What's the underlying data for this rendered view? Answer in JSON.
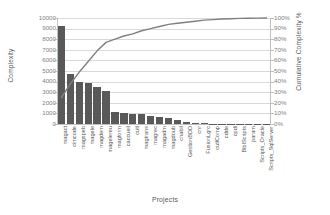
{
  "chart_data": {
    "type": "bar",
    "title": "",
    "xlabel": "Projects",
    "ylabel": "Complexity",
    "y2label": "Cumulative Complexity %",
    "ylim": [
      0,
      10000
    ],
    "y2lim": [
      0,
      100
    ],
    "grid": true,
    "legend": "none",
    "categories": [
      "magact",
      "cimcode",
      "magspeb",
      "magele",
      "magdem",
      "magelereu",
      "magform",
      "caccueil",
      "cutl",
      "magtrans",
      "magrec",
      "magadm",
      "magdoub",
      "chabil",
      "GestionBDD",
      "cnr",
      "FusionLgrc",
      "cutlComp",
      "cdde",
      "cpdi",
      "BiblScripts",
      "param",
      "Scripts_Oracle",
      "Scripts_SqlServer"
    ],
    "series": [
      {
        "name": "Complexity",
        "type": "bar",
        "color": "#595959",
        "axis": "left",
        "values": [
          9200,
          4700,
          4000,
          3850,
          3500,
          3100,
          1100,
          1050,
          980,
          940,
          800,
          700,
          600,
          420,
          230,
          120,
          70,
          45,
          30,
          22,
          16,
          10,
          6,
          4
        ]
      },
      {
        "name": "Cumulative Complexity %",
        "type": "line",
        "color": "#808080",
        "axis": "right",
        "values": [
          25,
          38,
          49,
          59,
          69,
          77,
          80,
          83,
          85,
          88,
          90,
          92,
          94,
          95,
          96,
          97,
          98,
          98.5,
          99,
          99.3,
          99.6,
          99.8,
          99.9,
          100
        ]
      }
    ],
    "y_ticks": [
      0,
      1000,
      2000,
      3000,
      4000,
      5000,
      6000,
      7000,
      8000,
      9000,
      10000
    ],
    "y_tick_labels": [
      "0",
      "1000",
      "2000",
      "3000",
      "4000",
      "5000",
      "6000",
      "7000",
      "8000",
      "9000",
      "10000"
    ],
    "y2_ticks": [
      0,
      10,
      20,
      30,
      40,
      50,
      60,
      70,
      80,
      90,
      100
    ],
    "y2_tick_labels": [
      "0%",
      "10%",
      "20%",
      "30%",
      "40%",
      "50%",
      "60%",
      "70%",
      "80%",
      "90%",
      "100%"
    ]
  }
}
